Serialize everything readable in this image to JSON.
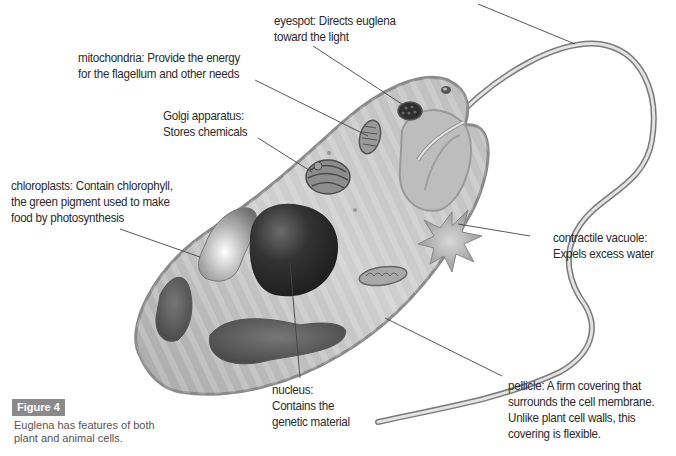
{
  "figure": {
    "badge": "Figure 4",
    "caption_lines": [
      "Euglena has features of both",
      "plant and animal cells."
    ]
  },
  "labels": {
    "top_cropped": {
      "lines": [
        "flagellum: ..."
      ],
      "note": ""
    },
    "eyespot": {
      "lines": [
        "eyespot: Directs euglena",
        "toward the light"
      ]
    },
    "mitochondria": {
      "lines": [
        "mitochondria: Provide the energy",
        "for the flagellum and other needs"
      ]
    },
    "golgi": {
      "lines": [
        "Golgi apparatus:",
        "Stores chemicals"
      ]
    },
    "chloroplasts": {
      "lines": [
        "chloroplasts: Contain chlorophyll,",
        "the green pigment used to make",
        "food by photosynthesis"
      ]
    },
    "contractile_vacuole": {
      "lines": [
        "contractile vacuole:",
        "Expels excess water"
      ]
    },
    "nucleus": {
      "lines": [
        "nucleus:",
        "Contains the",
        "genetic material"
      ]
    },
    "pellicle": {
      "lines": [
        "pellicle: A firm covering that",
        "surrounds the cell membrane.",
        "Unlike plant cell walls, this",
        "covering is flexible."
      ]
    }
  },
  "colors": {
    "badge_bg": "#8a8a8a",
    "text": "#2a2a2a",
    "caption_text": "#555555",
    "cell_fill": "#c9c9c9",
    "nucleus": "#2b2b2b",
    "leader_line": "#444444"
  }
}
